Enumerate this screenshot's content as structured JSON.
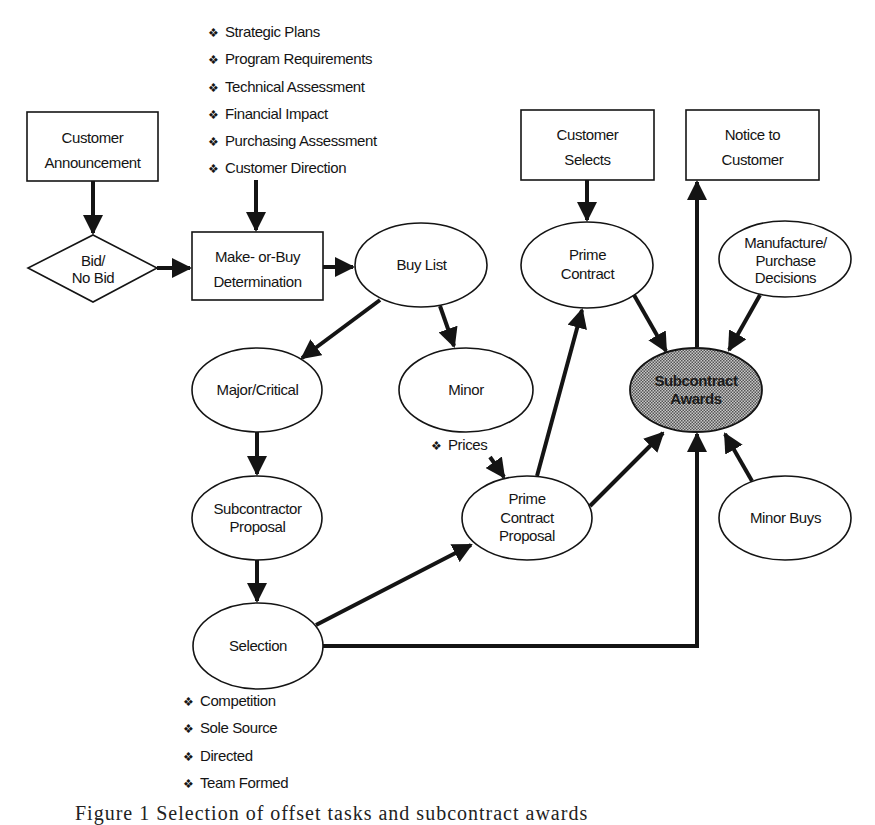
{
  "nodes": {
    "customer_announcement": {
      "lines": [
        "Customer",
        "Announcement"
      ]
    },
    "bid_no_bid": {
      "lines": [
        "Bid/",
        "No Bid"
      ]
    },
    "make_or_buy": {
      "lines": [
        "Make- or-Buy",
        "Determination"
      ]
    },
    "buy_list": {
      "lines": [
        "Buy List"
      ]
    },
    "customer_selects": {
      "lines": [
        "Customer",
        "Selects"
      ]
    },
    "notice_to_customer": {
      "lines": [
        "Notice to",
        "Customer"
      ]
    },
    "prime_contract": {
      "lines": [
        "Prime",
        "Contract"
      ]
    },
    "manufacture_purchase": {
      "lines": [
        "Manufacture/",
        "Purchase",
        "Decisions"
      ]
    },
    "major_critical": {
      "lines": [
        "Major/Critical"
      ]
    },
    "minor": {
      "lines": [
        "Minor"
      ]
    },
    "subcontract_awards": {
      "lines": [
        "Subcontract",
        "Awards"
      ]
    },
    "subcontractor_proposal": {
      "lines": [
        "Subcontractor",
        "Proposal"
      ]
    },
    "prime_contract_proposal": {
      "lines": [
        "Prime",
        "Contract",
        "Proposal"
      ]
    },
    "minor_buys": {
      "lines": [
        "Minor Buys"
      ]
    },
    "selection": {
      "lines": [
        "Selection"
      ]
    }
  },
  "inputs_make_or_buy": [
    "Strategic Plans",
    "Program Requirements",
    "Technical Assessment",
    "Financial Impact",
    "Purchasing Assessment",
    "Customer Direction"
  ],
  "minor_inputs": [
    "Prices"
  ],
  "selection_types": [
    "Competition",
    "Sole Source",
    "Directed",
    "Team Formed"
  ],
  "bullet_glyph": "❖",
  "caption": "Figure 1 Selection of offset tasks and subcontract awards",
  "colors": {
    "ink": "#141414",
    "highlight_fill": "#9a9a9a",
    "background": "#ffffff"
  }
}
